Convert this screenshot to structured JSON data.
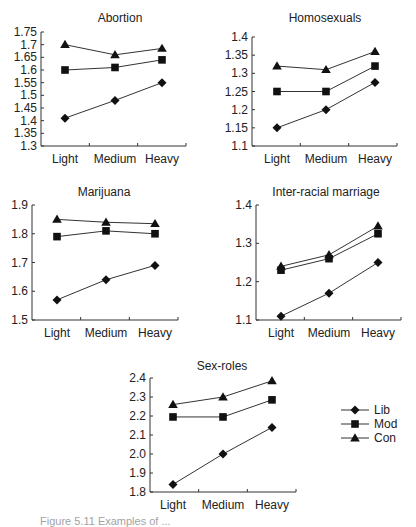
{
  "figure": {
    "caption": "Figure 5.11 Examples of ...",
    "legend": {
      "items": [
        {
          "label": "Lib",
          "marker": "diamond"
        },
        {
          "label": "Mod",
          "marker": "square"
        },
        {
          "label": "Con",
          "marker": "triangle"
        }
      ]
    }
  },
  "chart_data": [
    {
      "type": "line",
      "title": "Abortion",
      "categories": [
        "Light",
        "Medium",
        "Heavy"
      ],
      "ylim": [
        1.3,
        1.75
      ],
      "yticks": [
        1.3,
        1.35,
        1.4,
        1.45,
        1.5,
        1.55,
        1.6,
        1.65,
        1.7,
        1.75
      ],
      "ytick_labels": [
        "1.3",
        "1.35",
        "1.4",
        "1.45",
        "1.5",
        "1.55",
        "1.6",
        "1.65",
        "1.7",
        "1.75"
      ],
      "xlabel": "",
      "ylabel": "",
      "grid": false,
      "series": [
        {
          "name": "Lib",
          "values": [
            1.41,
            1.48,
            1.55
          ]
        },
        {
          "name": "Mod",
          "values": [
            1.6,
            1.61,
            1.64
          ]
        },
        {
          "name": "Con",
          "values": [
            1.7,
            1.66,
            1.685
          ]
        }
      ]
    },
    {
      "type": "line",
      "title": "Homosexuals",
      "categories": [
        "Light",
        "Medium",
        "Heavy"
      ],
      "ylim": [
        1.1,
        1.4
      ],
      "yticks": [
        1.1,
        1.15,
        1.2,
        1.25,
        1.3,
        1.35,
        1.4
      ],
      "ytick_labels": [
        "1.1",
        "1.15",
        "1.2",
        "1.25",
        "1.3",
        "1.35",
        "1.4"
      ],
      "xlabel": "",
      "ylabel": "",
      "grid": false,
      "series": [
        {
          "name": "Lib",
          "values": [
            1.15,
            1.2,
            1.275
          ]
        },
        {
          "name": "Mod",
          "values": [
            1.25,
            1.25,
            1.32
          ]
        },
        {
          "name": "Con",
          "values": [
            1.32,
            1.31,
            1.36
          ]
        }
      ]
    },
    {
      "type": "line",
      "title": "Marijuana",
      "categories": [
        "Light",
        "Medium",
        "Heavy"
      ],
      "ylim": [
        1.5,
        1.9
      ],
      "yticks": [
        1.5,
        1.6,
        1.7,
        1.8,
        1.9
      ],
      "ytick_labels": [
        "1.5",
        "1.6",
        "1.7",
        "1.8",
        "1.9"
      ],
      "xlabel": "",
      "ylabel": "",
      "grid": false,
      "series": [
        {
          "name": "Lib",
          "values": [
            1.57,
            1.64,
            1.69
          ]
        },
        {
          "name": "Mod",
          "values": [
            1.79,
            1.81,
            1.8
          ]
        },
        {
          "name": "Con",
          "values": [
            1.85,
            1.84,
            1.835
          ]
        }
      ]
    },
    {
      "type": "line",
      "title": "Inter-racial marriage",
      "categories": [
        "Light",
        "Medium",
        "Heavy"
      ],
      "ylim": [
        1.1,
        1.4
      ],
      "yticks": [
        1.1,
        1.2,
        1.3,
        1.4
      ],
      "ytick_labels": [
        "1.1",
        "1.2",
        "1.3",
        "1.4"
      ],
      "xlabel": "",
      "ylabel": "",
      "grid": false,
      "series": [
        {
          "name": "Lib",
          "values": [
            1.11,
            1.17,
            1.25
          ]
        },
        {
          "name": "Mod",
          "values": [
            1.23,
            1.26,
            1.325
          ]
        },
        {
          "name": "Con",
          "values": [
            1.24,
            1.27,
            1.345
          ]
        }
      ]
    },
    {
      "type": "line",
      "title": "Sex-roles",
      "categories": [
        "Light",
        "Medium",
        "Heavy"
      ],
      "ylim": [
        1.8,
        2.4
      ],
      "yticks": [
        1.8,
        1.9,
        2.0,
        2.1,
        2.2,
        2.3,
        2.4
      ],
      "ytick_labels": [
        "1.8",
        "1.9",
        "2.0",
        "2.1",
        "2.2",
        "2.3",
        "2.4"
      ],
      "xlabel": "",
      "ylabel": "",
      "grid": false,
      "series": [
        {
          "name": "Lib",
          "values": [
            1.84,
            2.0,
            2.14
          ]
        },
        {
          "name": "Mod",
          "values": [
            2.195,
            2.195,
            2.285
          ]
        },
        {
          "name": "Con",
          "values": [
            2.26,
            2.3,
            2.385
          ]
        }
      ]
    }
  ]
}
